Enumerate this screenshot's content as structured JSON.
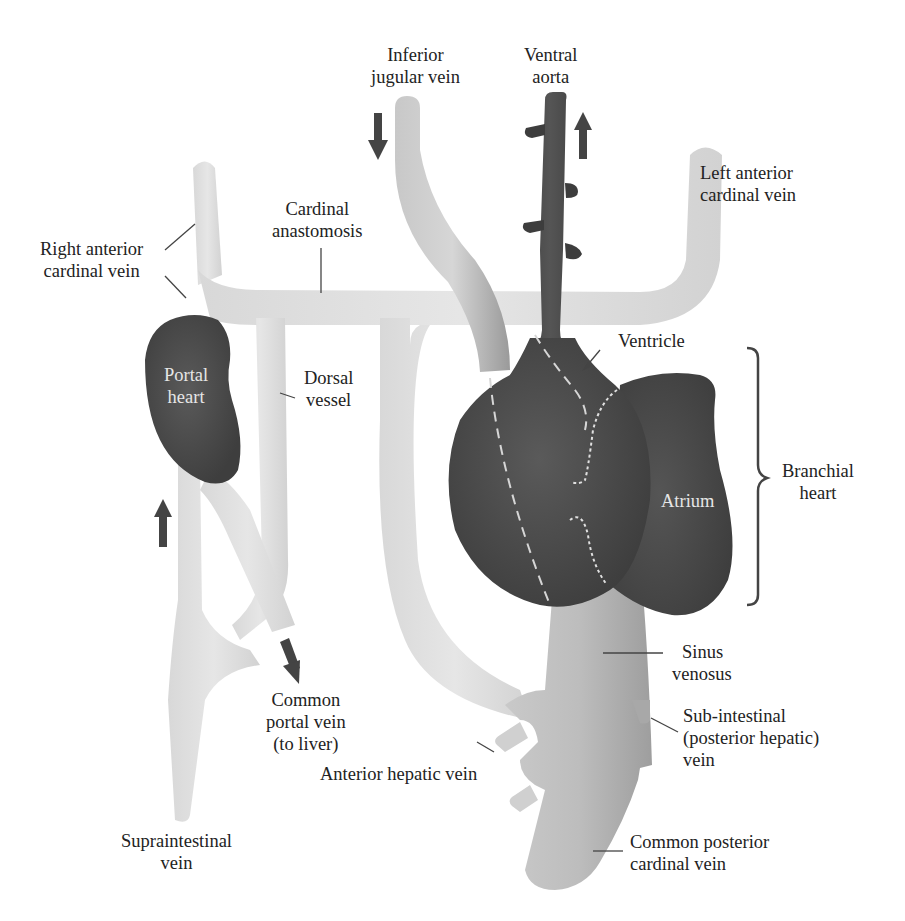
{
  "figure": {
    "colors": {
      "vein_light": "#dcdcdc",
      "vein_mid": "#bdbdbd",
      "heart_dark": "#4a4a4a",
      "aorta_dark": "#3d3d3d",
      "arrow": "#444444",
      "label_text": "#222222",
      "inverse_text": "#e8e8e8",
      "dashed_line": "#d9d9d9"
    }
  },
  "labels": {
    "inferior_jugular_vein": {
      "line1": "Inferior",
      "line2": "jugular vein"
    },
    "ventral_aorta": {
      "line1": "Ventral",
      "line2": "aorta"
    },
    "left_anterior_cardinal_vein": {
      "line1": "Left anterior",
      "line2": "cardinal vein"
    },
    "right_anterior_cardinal_vein": {
      "line1": "Right anterior",
      "line2": "cardinal vein"
    },
    "cardinal_anastomosis": {
      "line1": "Cardinal",
      "line2": "anastomosis"
    },
    "portal_heart": {
      "line1": "Portal",
      "line2": "heart"
    },
    "dorsal_vessel": {
      "line1": "Dorsal",
      "line2": "vessel"
    },
    "ventricle": {
      "line1": "Ventricle"
    },
    "atrium": {
      "line1": "Atrium"
    },
    "branchial_heart": {
      "line1": "Branchial",
      "line2": "heart"
    },
    "sinus_venosus": {
      "line1": "Sinus",
      "line2": "venosus"
    },
    "sub_intestinal_vein": {
      "line1": "Sub-intestinal",
      "line2": "(posterior hepatic)",
      "line3": "vein"
    },
    "common_portal_vein": {
      "line1": "Common",
      "line2": "portal vein",
      "line3": "(to liver)"
    },
    "anterior_hepatic_vein": {
      "line1": "Anterior hepatic vein"
    },
    "supraintestinal_vein": {
      "line1": "Supraintestinal",
      "line2": "vein"
    },
    "common_posterior_cardinal_vein": {
      "line1": "Common posterior",
      "line2": "cardinal vein"
    }
  },
  "flow_arrows": [
    {
      "name": "inferior-jugular-flow",
      "direction": "down"
    },
    {
      "name": "ventral-aorta-flow",
      "direction": "up"
    },
    {
      "name": "supraintestinal-flow",
      "direction": "up"
    },
    {
      "name": "portal-vein-flow",
      "direction": "down-right"
    }
  ]
}
